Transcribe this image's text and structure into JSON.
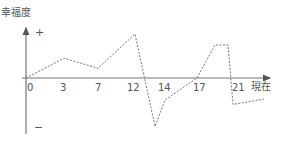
{
  "chart_data": {
    "type": "line",
    "title": "",
    "ylabel": "幸福度",
    "xlabel": "現在",
    "y_markers": {
      "positive": "+",
      "negative": "−"
    },
    "x_ticks": [
      "0",
      "3",
      "7",
      "12",
      "14",
      "17",
      "21"
    ],
    "series": [
      {
        "name": "幸福度",
        "style": "dashed",
        "points": [
          {
            "x": 0,
            "y": 0
          },
          {
            "x": 3,
            "y": 0.45
          },
          {
            "x": 7,
            "y": 0.22
          },
          {
            "x": 12,
            "y": 1.0
          },
          {
            "x": 13,
            "y": -1.1
          },
          {
            "x": 14,
            "y": -0.5
          },
          {
            "x": 17,
            "y": 0
          },
          {
            "x": 19,
            "y": 0.75
          },
          {
            "x": 20.3,
            "y": 0.75
          },
          {
            "x": 21,
            "y": -0.6
          },
          {
            "x": 24,
            "y": -0.48
          }
        ]
      }
    ],
    "grid": false,
    "legend": "none"
  },
  "labels": {
    "y_title": "幸福度",
    "plus": "+",
    "minus": "−",
    "now": "現在",
    "ticks": [
      "0",
      "3",
      "7",
      "12",
      "14",
      "17",
      "21"
    ]
  },
  "colors": {
    "axis": "#555555",
    "line": "#777777",
    "text": "#555555"
  }
}
